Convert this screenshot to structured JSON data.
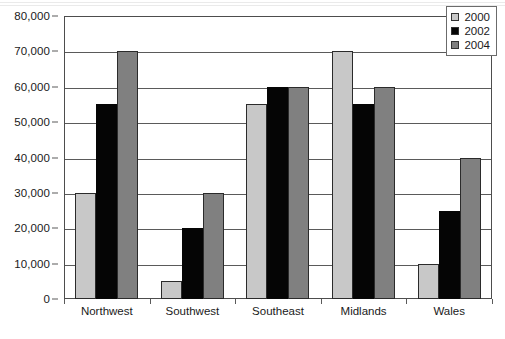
{
  "chart_data": {
    "type": "bar",
    "title": "",
    "subtitle": "",
    "xlabel": "",
    "ylabel": "",
    "categories": [
      "Northwest",
      "Southwest",
      "Southeast",
      "Midlands",
      "Wales"
    ],
    "series": [
      {
        "name": "2000",
        "color": "#c8c8c8",
        "values": [
          30000,
          5000,
          55000,
          70000,
          10000
        ]
      },
      {
        "name": "2002",
        "color": "#050505",
        "values": [
          55000,
          20000,
          60000,
          55000,
          25000
        ]
      },
      {
        "name": "2004",
        "color": "#808080",
        "values": [
          70000,
          30000,
          60000,
          60000,
          40000
        ]
      }
    ],
    "ylim": [
      0,
      80000
    ],
    "ytick_values": [
      0,
      10000,
      20000,
      30000,
      40000,
      50000,
      60000,
      70000,
      80000
    ],
    "ytick_labels": [
      "0",
      "10,000",
      "20,000",
      "30,000",
      "40,000",
      "50,000",
      "60,000",
      "70,000",
      "80,000"
    ],
    "grid": true,
    "grid_axis": "y",
    "legend_position": "top-right",
    "legend_entries": [
      "2000",
      "2002",
      "2004"
    ],
    "bar_mode": "grouped"
  },
  "colors": {
    "series_2000": "#c8c8c8",
    "series_2002": "#050505",
    "series_2004": "#808080",
    "axis": "#4d4d4d",
    "gridline": "#5a5a5a",
    "text": "#1a1a1a",
    "background": "#ffffff"
  }
}
